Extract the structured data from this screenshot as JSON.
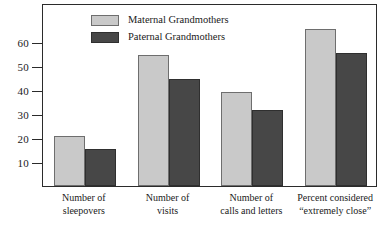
{
  "chart_data": {
    "type": "bar",
    "title": "",
    "xlabel": "",
    "ylabel": "",
    "ylim": [
      0,
      70
    ],
    "grid": false,
    "legend_position": "top-left",
    "yticks": [
      10,
      20,
      30,
      40,
      50,
      60
    ],
    "ytick_labels": [
      "10",
      "20",
      "30",
      "40",
      "50",
      "60"
    ],
    "categories": [
      "Number of sleepovers",
      "Number of visits",
      "Number of calls and letters",
      "Percent considered “extremely close”"
    ],
    "category_lines": [
      [
        "Number of",
        "sleepovers"
      ],
      [
        "Number of",
        "visits"
      ],
      [
        "Number of",
        "calls and letters"
      ],
      [
        "Percent considered",
        "“extremely close”"
      ]
    ],
    "series": [
      {
        "name": "Maternal Grandmothers",
        "color": "#c9c9c9",
        "values": [
          21,
          54.5,
          39,
          65.5
        ]
      },
      {
        "name": "Paternal Grandmothers",
        "color": "#474747",
        "values": [
          15.5,
          44.5,
          31.5,
          55.5
        ]
      }
    ]
  },
  "legend": {
    "items": [
      {
        "label": "Maternal Grandmothers",
        "swatch": "maternal"
      },
      {
        "label": "Paternal Grandmothers",
        "swatch": "paternal"
      }
    ]
  },
  "axis": {
    "y_tick_labels": [
      "60",
      "50",
      "40",
      "30",
      "20",
      "10"
    ]
  }
}
